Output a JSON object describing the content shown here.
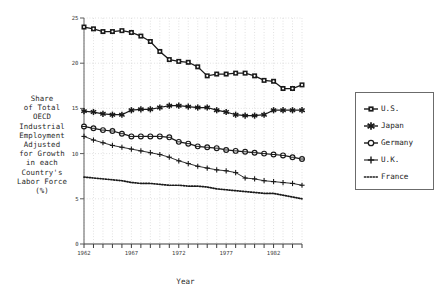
{
  "chart_data": {
    "type": "line",
    "title": "",
    "xlabel": "Year",
    "ylabel": "Share of Total OECD Industrial Employment Adjusted for Growth in each Country's Labor Force (%)",
    "ylabel_lines": [
      "Share",
      "of Total",
      "OECD",
      "Industrial",
      "Employment",
      "Adjusted",
      "for Growth",
      "in each",
      "Country's",
      "Labor Force",
      "(%)"
    ],
    "xlim": [
      1962,
      1985
    ],
    "ylim": [
      0,
      25
    ],
    "ytick_labels": [
      "0",
      "5",
      "10",
      "15",
      "20",
      "25"
    ],
    "yticks": [
      0,
      5,
      10,
      15,
      20,
      25
    ],
    "xtick_labels": [
      "1962",
      "1967",
      "1972",
      "1977",
      "1982"
    ],
    "xticks_labeled": [
      1962,
      1967,
      1972,
      1977,
      1982
    ],
    "xticks_all": [
      1962,
      1963,
      1964,
      1965,
      1966,
      1967,
      1968,
      1969,
      1970,
      1971,
      1972,
      1973,
      1974,
      1975,
      1976,
      1977,
      1978,
      1979,
      1980,
      1981,
      1982,
      1983,
      1984,
      1985
    ],
    "grid": true,
    "grid_style": "dotted",
    "legend_position": "right-outside",
    "x": [
      1962,
      1963,
      1964,
      1965,
      1966,
      1967,
      1968,
      1969,
      1970,
      1971,
      1972,
      1973,
      1974,
      1975,
      1976,
      1977,
      1978,
      1979,
      1980,
      1981,
      1982,
      1983,
      1984,
      1985
    ],
    "series": [
      {
        "name": "U.S.",
        "marker": "filled-square-circle",
        "line": "solid",
        "color": "#1a1a1a",
        "values": [
          24.0,
          23.8,
          23.5,
          23.5,
          23.6,
          23.4,
          23.0,
          22.4,
          21.3,
          20.4,
          20.2,
          20.1,
          19.6,
          18.6,
          18.8,
          18.8,
          18.9,
          18.9,
          18.6,
          18.1,
          18.0,
          17.2,
          17.2,
          17.6
        ]
      },
      {
        "name": "Japan",
        "marker": "star",
        "line": "solid",
        "color": "#1a1a1a",
        "values": [
          14.7,
          14.6,
          14.4,
          14.3,
          14.3,
          14.8,
          14.9,
          14.9,
          15.1,
          15.3,
          15.3,
          15.2,
          15.1,
          15.1,
          14.8,
          14.6,
          14.3,
          14.2,
          14.2,
          14.3,
          14.8,
          14.8,
          14.8,
          14.8
        ]
      },
      {
        "name": "Germany",
        "marker": "open-circle",
        "line": "solid",
        "color": "#1a1a1a",
        "values": [
          13.0,
          12.8,
          12.6,
          12.5,
          12.2,
          11.9,
          11.9,
          11.9,
          11.9,
          11.8,
          11.3,
          11.1,
          10.8,
          10.7,
          10.6,
          10.4,
          10.3,
          10.2,
          10.1,
          10.0,
          9.9,
          9.8,
          9.6,
          9.4
        ]
      },
      {
        "name": "U.K.",
        "marker": "plus",
        "line": "solid",
        "color": "#1a1a1a",
        "values": [
          11.9,
          11.5,
          11.2,
          10.9,
          10.7,
          10.5,
          10.3,
          10.1,
          9.9,
          9.6,
          9.2,
          8.9,
          8.6,
          8.4,
          8.2,
          8.1,
          7.9,
          7.3,
          7.2,
          7.0,
          6.9,
          6.8,
          6.7,
          6.5
        ]
      },
      {
        "name": "France",
        "marker": "none",
        "line": "dotted",
        "color": "#1a1a1a",
        "values": [
          7.4,
          7.3,
          7.2,
          7.1,
          7.0,
          6.8,
          6.7,
          6.7,
          6.6,
          6.5,
          6.5,
          6.4,
          6.4,
          6.3,
          6.1,
          6.0,
          5.9,
          5.8,
          5.7,
          5.6,
          5.6,
          5.4,
          5.2,
          5.0
        ]
      }
    ]
  },
  "legend": {
    "items": [
      {
        "label": "U.S.",
        "marker": "filled-square-circle"
      },
      {
        "label": "Japan",
        "marker": "star"
      },
      {
        "label": "Germany",
        "marker": "open-circle"
      },
      {
        "label": "U.K.",
        "marker": "plus"
      },
      {
        "label": "France",
        "marker": "dotted-line"
      }
    ]
  }
}
